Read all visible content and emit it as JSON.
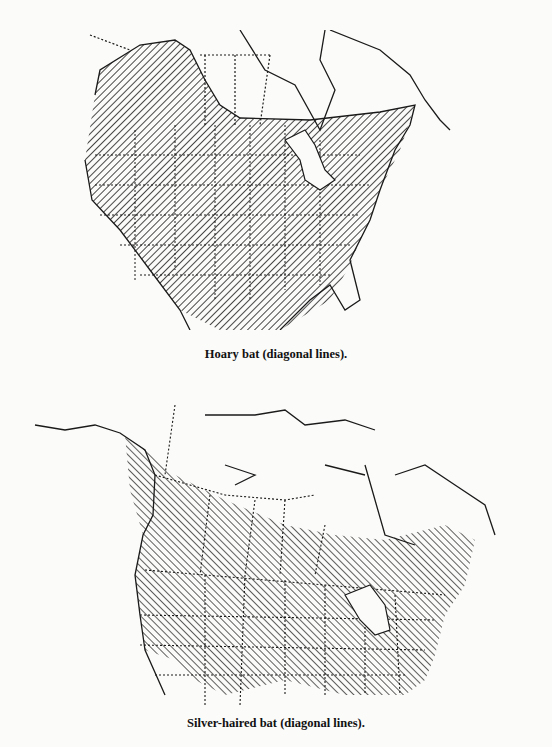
{
  "figures": [
    {
      "species": "Hoary bat",
      "caption": "Hoary bat (diagonal lines).",
      "region_shown": "North America (Alaska/Canada, United States, northern Mexico)",
      "range_pattern": "diagonal lines",
      "range_description": "Southern Canada and western Canada north to the Yukon, all of the contiguous United States, and into Mexico"
    },
    {
      "species": "Silver-haired bat",
      "caption": "Silver-haired bat (diagonal lines).",
      "region_shown": "North America (Alaska, Canada, United States, northern Mexico)",
      "range_pattern": "diagonal lines",
      "range_description": "Southeastern Alaska coast, southern Canada, and most of the United States except the extreme south"
    }
  ],
  "colors": {
    "ink": "#1a1a1a",
    "paper": "#fbfbf9"
  }
}
